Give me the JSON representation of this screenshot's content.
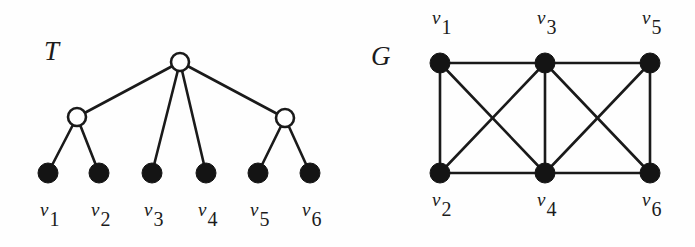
{
  "figure": {
    "width": 695,
    "height": 247,
    "background_color": "#fefefe",
    "ink_color": "#1a1a1a"
  },
  "tree_panel": {
    "name_label": "T",
    "name_label_position": {
      "x": 44,
      "y": 38
    },
    "description": "Rooted tree with one root, two internal nodes and six leaves",
    "nodes": {
      "open_nodes": [
        {
          "id": "root",
          "cx": 180,
          "cy": 62,
          "r": 9
        },
        {
          "id": "internal-left",
          "cx": 77,
          "cy": 117,
          "r": 9
        },
        {
          "id": "internal-right",
          "cx": 285,
          "cy": 118,
          "r": 9
        }
      ],
      "leaf_nodes": [
        {
          "id": "leaf-v1",
          "cx": 48,
          "cy": 173,
          "r": 10,
          "label": "v",
          "subscript": "1"
        },
        {
          "id": "leaf-v2",
          "cx": 99,
          "cy": 173,
          "r": 10,
          "label": "v",
          "subscript": "2"
        },
        {
          "id": "leaf-v3",
          "cx": 152,
          "cy": 173,
          "r": 10,
          "label": "v",
          "subscript": "3"
        },
        {
          "id": "leaf-v4",
          "cx": 206,
          "cy": 173,
          "r": 10,
          "label": "v",
          "subscript": "4"
        },
        {
          "id": "leaf-v5",
          "cx": 258,
          "cy": 173,
          "r": 10,
          "label": "v",
          "subscript": "5"
        },
        {
          "id": "leaf-v6",
          "cx": 310,
          "cy": 173,
          "r": 10,
          "label": "v",
          "subscript": "6"
        }
      ]
    },
    "edges": [
      {
        "from": "root",
        "to": "internal-left",
        "x1": 180,
        "y1": 62,
        "x2": 77,
        "y2": 117
      },
      {
        "from": "root",
        "to": "leaf-v3",
        "x1": 180,
        "y1": 62,
        "x2": 152,
        "y2": 173
      },
      {
        "from": "root",
        "to": "leaf-v4",
        "x1": 180,
        "y1": 62,
        "x2": 206,
        "y2": 173
      },
      {
        "from": "root",
        "to": "internal-right",
        "x1": 180,
        "y1": 62,
        "x2": 285,
        "y2": 118
      },
      {
        "from": "internal-left",
        "to": "leaf-v1",
        "x1": 77,
        "y1": 117,
        "x2": 48,
        "y2": 173
      },
      {
        "from": "internal-left",
        "to": "leaf-v2",
        "x1": 77,
        "y1": 117,
        "x2": 99,
        "y2": 173
      },
      {
        "from": "internal-right",
        "to": "leaf-v5",
        "x1": 285,
        "y1": 118,
        "x2": 258,
        "y2": 173
      },
      {
        "from": "internal-right",
        "to": "leaf-v6",
        "x1": 285,
        "y1": 118,
        "x2": 310,
        "y2": 173
      }
    ],
    "vertex_labels": [
      {
        "id": "tree-label-v1",
        "symbol": "v",
        "subscript": "1",
        "x": 40,
        "y": 200
      },
      {
        "id": "tree-label-v2",
        "symbol": "v",
        "subscript": "2",
        "x": 91,
        "y": 200
      },
      {
        "id": "tree-label-v3",
        "symbol": "v",
        "subscript": "3",
        "x": 144,
        "y": 200
      },
      {
        "id": "tree-label-v4",
        "symbol": "v",
        "subscript": "4",
        "x": 198,
        "y": 200
      },
      {
        "id": "tree-label-v5",
        "symbol": "v",
        "subscript": "5",
        "x": 250,
        "y": 200
      },
      {
        "id": "tree-label-v6",
        "symbol": "v",
        "subscript": "6",
        "x": 302,
        "y": 200
      }
    ]
  },
  "graph_panel": {
    "name_label": "G",
    "name_label_position": {
      "x": 371,
      "y": 43
    },
    "description": "Six-vertex graph consisting of two K4 blocks sharing the edge v3-v4",
    "nodes": [
      {
        "id": "g-v1",
        "cx": 440,
        "cy": 63,
        "r": 10,
        "label": "v",
        "subscript": "1"
      },
      {
        "id": "g-v3",
        "cx": 545,
        "cy": 63,
        "r": 10,
        "label": "v",
        "subscript": "3"
      },
      {
        "id": "g-v5",
        "cx": 650,
        "cy": 63,
        "r": 10,
        "label": "v",
        "subscript": "5"
      },
      {
        "id": "g-v2",
        "cx": 440,
        "cy": 173,
        "r": 10,
        "label": "v",
        "subscript": "2"
      },
      {
        "id": "g-v4",
        "cx": 545,
        "cy": 173,
        "r": 10,
        "label": "v",
        "subscript": "4"
      },
      {
        "id": "g-v6",
        "cx": 650,
        "cy": 173,
        "r": 10,
        "label": "v",
        "subscript": "6"
      }
    ],
    "edges": [
      {
        "from": "g-v1",
        "to": "g-v3",
        "x1": 440,
        "y1": 63,
        "x2": 545,
        "y2": 63
      },
      {
        "from": "g-v3",
        "to": "g-v5",
        "x1": 545,
        "y1": 63,
        "x2": 650,
        "y2": 63
      },
      {
        "from": "g-v2",
        "to": "g-v4",
        "x1": 440,
        "y1": 173,
        "x2": 545,
        "y2": 173
      },
      {
        "from": "g-v4",
        "to": "g-v6",
        "x1": 545,
        "y1": 173,
        "x2": 650,
        "y2": 173
      },
      {
        "from": "g-v1",
        "to": "g-v2",
        "x1": 440,
        "y1": 63,
        "x2": 440,
        "y2": 173
      },
      {
        "from": "g-v3",
        "to": "g-v4",
        "x1": 545,
        "y1": 63,
        "x2": 545,
        "y2": 173
      },
      {
        "from": "g-v5",
        "to": "g-v6",
        "x1": 650,
        "y1": 63,
        "x2": 650,
        "y2": 173
      },
      {
        "from": "g-v1",
        "to": "g-v4",
        "x1": 440,
        "y1": 63,
        "x2": 545,
        "y2": 173
      },
      {
        "from": "g-v2",
        "to": "g-v3",
        "x1": 440,
        "y1": 173,
        "x2": 545,
        "y2": 63
      },
      {
        "from": "g-v3",
        "to": "g-v6",
        "x1": 545,
        "y1": 63,
        "x2": 650,
        "y2": 173
      },
      {
        "from": "g-v4",
        "to": "g-v5",
        "x1": 545,
        "y1": 173,
        "x2": 650,
        "y2": 63
      }
    ],
    "vertex_labels": [
      {
        "id": "graph-label-v1",
        "symbol": "v",
        "subscript": "1",
        "x": 432,
        "y": 8
      },
      {
        "id": "graph-label-v3",
        "symbol": "v",
        "subscript": "3",
        "x": 537,
        "y": 8
      },
      {
        "id": "graph-label-v5",
        "symbol": "v",
        "subscript": "5",
        "x": 642,
        "y": 8
      },
      {
        "id": "graph-label-v2",
        "symbol": "v",
        "subscript": "2",
        "x": 432,
        "y": 190
      },
      {
        "id": "graph-label-v4",
        "symbol": "v",
        "subscript": "4",
        "x": 537,
        "y": 190
      },
      {
        "id": "graph-label-v6",
        "symbol": "v",
        "subscript": "6",
        "x": 642,
        "y": 190
      }
    ]
  }
}
